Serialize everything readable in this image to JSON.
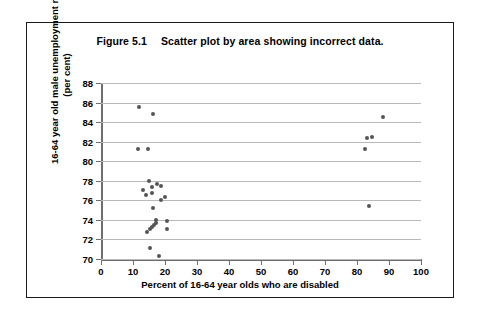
{
  "figure": {
    "caption_number": "Figure 5.1",
    "caption_text": "Scatter plot by area showing incorrect data."
  },
  "chart_data": {
    "type": "scatter",
    "title": "Scatter plot by area showing incorrect data.",
    "xlabel": "Percent of 16-64 year olds who are disabled",
    "ylabel": "16-64 year old male unemployment rate (per cent)",
    "xlim": [
      0,
      100
    ],
    "ylim": [
      70,
      88
    ],
    "xticks": [
      0,
      10,
      20,
      30,
      40,
      50,
      60,
      70,
      80,
      90,
      100
    ],
    "yticks": [
      70,
      72,
      74,
      76,
      78,
      80,
      82,
      84,
      86,
      88
    ],
    "grid": "horizontal",
    "legend": null,
    "marker": "filled-circle",
    "marker_color": "#555555",
    "points": [
      {
        "x": 12.0,
        "y": 85.5
      },
      {
        "x": 16.2,
        "y": 84.8
      },
      {
        "x": 11.5,
        "y": 81.3
      },
      {
        "x": 14.6,
        "y": 81.3
      },
      {
        "x": 15.0,
        "y": 78.0
      },
      {
        "x": 17.6,
        "y": 77.7
      },
      {
        "x": 18.8,
        "y": 77.5
      },
      {
        "x": 13.0,
        "y": 77.1
      },
      {
        "x": 16.0,
        "y": 77.4
      },
      {
        "x": 15.9,
        "y": 76.7
      },
      {
        "x": 14.1,
        "y": 76.5
      },
      {
        "x": 19.9,
        "y": 76.3
      },
      {
        "x": 18.6,
        "y": 76.0
      },
      {
        "x": 16.3,
        "y": 75.2
      },
      {
        "x": 17.3,
        "y": 74.0
      },
      {
        "x": 15.2,
        "y": 73.1
      },
      {
        "x": 15.9,
        "y": 73.3
      },
      {
        "x": 16.5,
        "y": 73.5
      },
      {
        "x": 17.1,
        "y": 73.7
      },
      {
        "x": 20.6,
        "y": 73.9
      },
      {
        "x": 20.6,
        "y": 73.1
      },
      {
        "x": 14.4,
        "y": 72.8
      },
      {
        "x": 15.3,
        "y": 71.1
      },
      {
        "x": 18.0,
        "y": 70.3
      },
      {
        "x": 88.2,
        "y": 84.5
      },
      {
        "x": 83.2,
        "y": 82.4
      },
      {
        "x": 84.6,
        "y": 82.5
      },
      {
        "x": 82.5,
        "y": 81.2
      },
      {
        "x": 83.7,
        "y": 75.4
      }
    ]
  }
}
